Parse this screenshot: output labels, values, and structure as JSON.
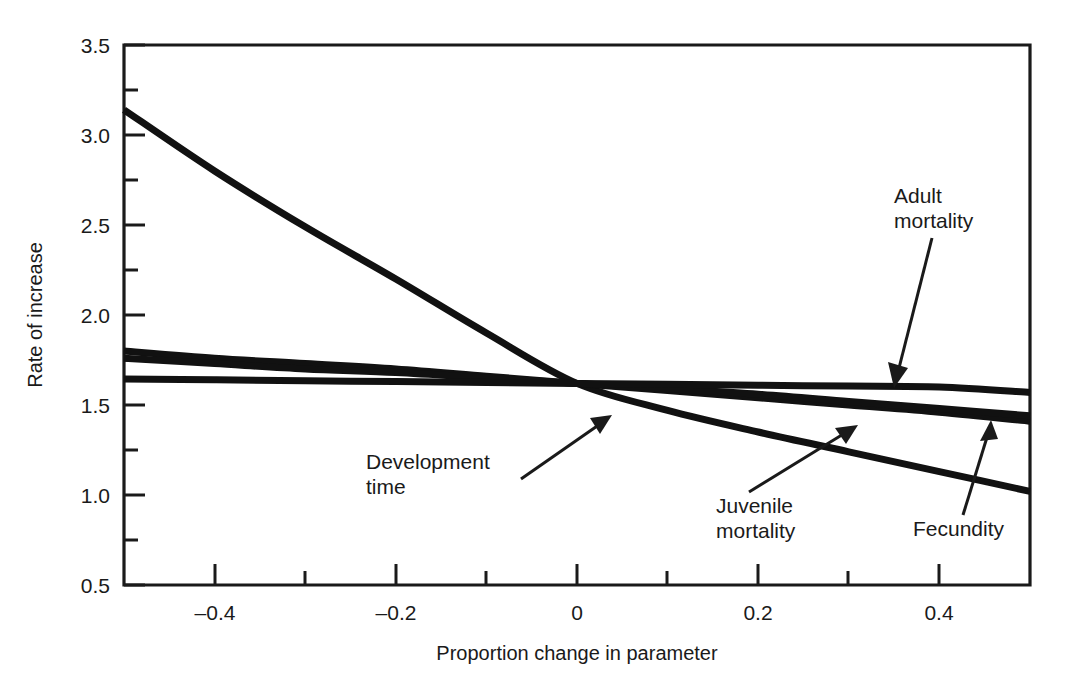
{
  "chart_data": {
    "type": "line",
    "title": "",
    "xlabel": "Proportion change in parameter",
    "ylabel": "Rate of increase",
    "xlim": [
      -0.5,
      0.5
    ],
    "ylim": [
      0.5,
      3.5
    ],
    "grid": false,
    "legend_position": "none",
    "x_ticks_major": [
      -0.4,
      -0.2,
      0,
      0.2,
      0.4
    ],
    "x_ticklabels": [
      "–0.4",
      "–0.2",
      "0",
      "0.2",
      "0.4"
    ],
    "x_ticks_minor": [
      -0.5,
      -0.3,
      -0.1,
      0.1,
      0.3,
      0.5
    ],
    "y_ticks_major": [
      0.5,
      1.0,
      1.5,
      2.0,
      2.5,
      3.0,
      3.5
    ],
    "y_ticklabels": [
      "0.5",
      "1.0",
      "1.5",
      "2.0",
      "2.5",
      "3.0",
      "3.5"
    ],
    "y_ticks_minor": [
      0.75,
      1.25,
      1.75,
      2.25,
      2.75,
      3.25
    ],
    "x": [
      -0.5,
      -0.4,
      -0.3,
      -0.2,
      -0.1,
      0,
      0.1,
      0.2,
      0.3,
      0.4,
      0.5
    ],
    "series": [
      {
        "name": "Development time",
        "values": [
          3.14,
          2.8,
          2.49,
          2.2,
          1.9,
          1.62,
          1.47,
          1.35,
          1.24,
          1.13,
          1.02
        ]
      },
      {
        "name": "Juvenile mortality",
        "values": [
          1.8,
          1.76,
          1.73,
          1.7,
          1.66,
          1.62,
          1.58,
          1.54,
          1.5,
          1.46,
          1.41
        ]
      },
      {
        "name": "Fecundity",
        "values": [
          1.76,
          1.73,
          1.7,
          1.68,
          1.65,
          1.62,
          1.59,
          1.56,
          1.52,
          1.48,
          1.44
        ]
      },
      {
        "name": "Adult mortality",
        "values": [
          1.645,
          1.64,
          1.635,
          1.63,
          1.625,
          1.62,
          1.615,
          1.61,
          1.605,
          1.6,
          1.57
        ]
      }
    ],
    "annotations": [
      {
        "id": "adult-mortality",
        "label_line1": "Adult",
        "label_line2": "mortality",
        "points_to": "Adult mortality curve near x = 0.37"
      },
      {
        "id": "development-time",
        "label_line1": "Development",
        "label_line2": "time",
        "points_to": "Development time curve near x = 0.02"
      },
      {
        "id": "juvenile-mortality",
        "label_line1": "Juvenile",
        "label_line2": "mortality",
        "points_to": "Juvenile mortality curve near x = 0.33"
      },
      {
        "id": "fecundity",
        "label_line1": "Fecundity",
        "label_line2": "",
        "points_to": "Fecundity curve near x = 0.44"
      }
    ],
    "colors": {
      "line": "#111111",
      "axis": "#1a1a1a",
      "background": "#ffffff",
      "text": "#1a1a1a"
    }
  }
}
